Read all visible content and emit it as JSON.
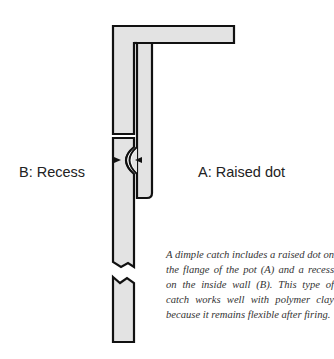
{
  "diagram": {
    "colors": {
      "fill": "#e3e3e3",
      "stroke": "#111111",
      "text": "#222222"
    },
    "labels": {
      "recess": "B: Recess",
      "raised_dot": "A: Raised dot"
    },
    "caption": "A dimple catch includes a raised dot on the flange of the pot (A) and a recess on the inside wall (B). This type of catch works well with polymer clay because it remains flexible after firing."
  }
}
